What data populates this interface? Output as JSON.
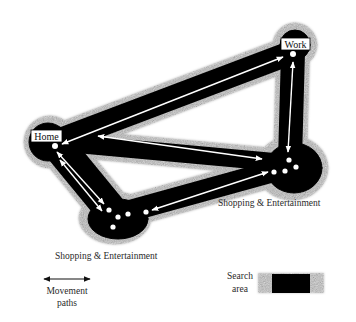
{
  "diagram": {
    "nodes": {
      "home": {
        "label": "Home"
      },
      "work": {
        "label": "Work"
      },
      "shopping_right": {
        "label": "Shopping & Entertainment"
      },
      "shopping_bottom": {
        "label": "Shopping & Entertainment"
      }
    },
    "edges": [
      {
        "from": "home",
        "to": "work",
        "direction": "both"
      },
      {
        "from": "work",
        "to": "shopping_right",
        "direction": "both"
      },
      {
        "from": "home",
        "to": "shopping_right",
        "direction": "both"
      },
      {
        "from": "home",
        "to": "shopping_bottom",
        "direction": "both",
        "count": 2
      },
      {
        "from": "shopping_bottom",
        "to": "shopping_right",
        "direction": "both"
      }
    ],
    "legend": {
      "movement": {
        "line1": "Movement",
        "line2": "paths"
      },
      "search": {
        "line1": "Search",
        "line2": "area"
      }
    },
    "colors": {
      "search_core": "#000000",
      "search_halo": "#b8b8b8",
      "path": "#ffffff",
      "background": "#ffffff"
    }
  }
}
